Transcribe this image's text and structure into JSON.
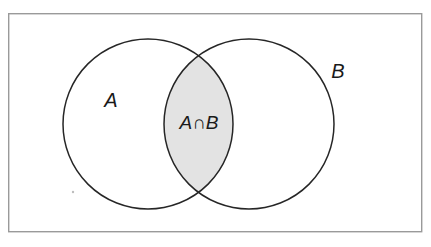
{
  "figure": {
    "kind": "venn-diagram",
    "title": "",
    "background_color": "#ffffff",
    "frame": {
      "name": "universal-set-rectangle",
      "x": 8,
      "y": 13,
      "width": 414,
      "height": 219,
      "stroke_color": "#9a9a9a",
      "stroke_width": 1.4,
      "fill_color": "#ffffff"
    },
    "sets": [
      {
        "id": "A",
        "label": "A",
        "label_x": 111,
        "label_y": 107,
        "circle": {
          "cx": 148,
          "cy": 124,
          "r": 85
        },
        "stroke_color": "#262626",
        "stroke_width": 1.5,
        "fill_color": "none"
      },
      {
        "id": "B",
        "label": "B",
        "label_x": 338,
        "label_y": 78,
        "circle": {
          "cx": 249,
          "cy": 124,
          "r": 85
        },
        "stroke_color": "#262626",
        "stroke_width": 1.5,
        "fill_color": "none"
      }
    ],
    "intersection": {
      "id": "A-and-B",
      "label": "A∩B",
      "label_x": 199,
      "label_y": 129,
      "fill_color": "#e3e3e3",
      "shaded": true
    },
    "artifact": {
      "name": "scan-speck",
      "x": 73,
      "y": 192,
      "r": 1.2,
      "color": "#bdbdbd"
    }
  }
}
